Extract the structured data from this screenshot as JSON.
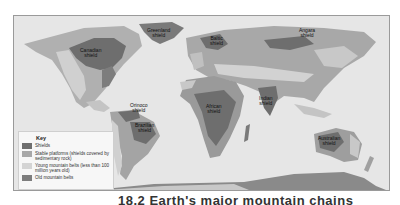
{
  "figure": {
    "caption": "18.2 Earth's major mountain chains"
  },
  "map": {
    "colors": {
      "ocean": "#e6e6e6",
      "shields": "#6e6e6e",
      "stable_platforms": "#9a9a9a",
      "young_mountain_belts": "#c8c8c8",
      "old_mountain_belts": "#7d7d7d",
      "land_light": "#b4b4b4",
      "antarctica": "#8a8a8a"
    },
    "labels": [
      {
        "id": "greenland",
        "text": "Greenland\nshield"
      },
      {
        "id": "canadian",
        "text": "Canadian\nshield"
      },
      {
        "id": "baltic",
        "text": "Baltic\nshield"
      },
      {
        "id": "angara",
        "text": "Angara\nshield"
      },
      {
        "id": "orinoco",
        "text": "Orinoco\nshield"
      },
      {
        "id": "brazilian",
        "text": "Brazilian\nshield"
      },
      {
        "id": "african",
        "text": "African\nshield"
      },
      {
        "id": "indian",
        "text": "Indian\nshield"
      },
      {
        "id": "australian",
        "text": "Australian\nshield"
      }
    ]
  },
  "key": {
    "title": "Key",
    "items": [
      {
        "label": "Shields",
        "color": "#6e6e6e"
      },
      {
        "label": "Stable platforms (shields covered by sedimentary rock)",
        "color": "#a8a8a8"
      },
      {
        "label": "Young mountain belts (less than 100 million years old)",
        "color": "#d4d4d4"
      },
      {
        "label": "Old mountain belts",
        "color": "#7d7d7d"
      }
    ]
  }
}
